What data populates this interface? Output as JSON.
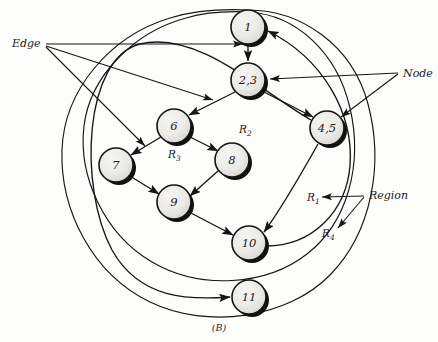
{
  "figure": {
    "caption": "(B)",
    "background_color": "#fdfdfc",
    "ink_color": "#161616",
    "node_fill_light": "#f0efed",
    "node_fill_dark": "#d8d7d4",
    "node_shadow_color": "#111111"
  },
  "annotations": {
    "edge_label": "Edge",
    "node_label": "Node",
    "region_label": "Region"
  },
  "nodes": [
    {
      "id": "n1",
      "label": "1",
      "cx": 248,
      "cy": 27,
      "r": 17
    },
    {
      "id": "n23",
      "label": "2,3",
      "cx": 248,
      "cy": 80,
      "r": 17
    },
    {
      "id": "n45",
      "label": "4,5",
      "cx": 327,
      "cy": 128,
      "r": 17
    },
    {
      "id": "n6",
      "label": "6",
      "cx": 174,
      "cy": 126,
      "r": 17
    },
    {
      "id": "n7",
      "label": "7",
      "cx": 116,
      "cy": 165,
      "r": 17
    },
    {
      "id": "n8",
      "label": "8",
      "cx": 232,
      "cy": 160,
      "r": 17
    },
    {
      "id": "n9",
      "label": "9",
      "cx": 174,
      "cy": 202,
      "r": 17
    },
    {
      "id": "n10",
      "label": "10",
      "cx": 249,
      "cy": 243,
      "r": 17
    },
    {
      "id": "n11",
      "label": "11",
      "cx": 249,
      "cy": 297,
      "r": 17
    }
  ],
  "edges": [
    {
      "from": "n1",
      "to": "n23",
      "kind": "straight"
    },
    {
      "from": "n23",
      "to": "n6",
      "kind": "straight"
    },
    {
      "from": "n23",
      "to": "n45",
      "kind": "straight"
    },
    {
      "from": "n6",
      "to": "n7",
      "kind": "straight"
    },
    {
      "from": "n6",
      "to": "n8",
      "kind": "straight"
    },
    {
      "from": "n7",
      "to": "n9",
      "kind": "straight"
    },
    {
      "from": "n8",
      "to": "n9",
      "kind": "straight"
    },
    {
      "from": "n9",
      "to": "n10",
      "kind": "straight"
    },
    {
      "from": "n45",
      "to": "n10",
      "kind": "curved"
    },
    {
      "from": "n10",
      "to": "n1",
      "kind": "curved-outer-right"
    },
    {
      "from": "n45",
      "to": "n11",
      "kind": "curved-outer-left"
    }
  ],
  "regions": [
    {
      "id": "R1",
      "base": "R",
      "subscript": "1",
      "x": 307,
      "y": 201
    },
    {
      "id": "R2",
      "base": "R",
      "subscript": "2",
      "x": 239,
      "y": 133
    },
    {
      "id": "R3",
      "base": "R",
      "subscript": "3",
      "x": 168,
      "y": 158
    },
    {
      "id": "R4",
      "base": "R",
      "subscript": "4",
      "x": 322,
      "y": 237
    }
  ],
  "pointer_labels": {
    "edge": {
      "x": 12,
      "y": 47,
      "targets": [
        "edge-1-to-23",
        "edge-23-to-6",
        "edge-6-to-7"
      ]
    },
    "node": {
      "x": 404,
      "y": 75,
      "targets": [
        "node-2-3",
        "node-4-5"
      ]
    },
    "region": {
      "x": 369,
      "y": 199,
      "targets": [
        "region-R1",
        "region-R4"
      ]
    }
  }
}
